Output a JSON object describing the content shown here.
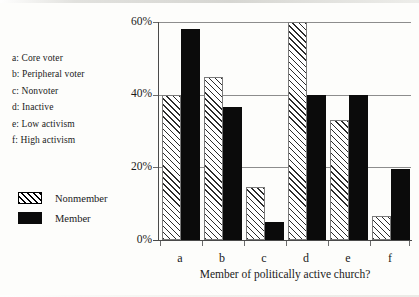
{
  "chart_data": {
    "type": "bar",
    "title": "",
    "xlabel": "Member of politically active church?",
    "ylabel": "",
    "categories": [
      "a",
      "b",
      "c",
      "d",
      "e",
      "f"
    ],
    "category_key": [
      "a: Core voter",
      "b: Peripheral voter",
      "c: Nonvoter",
      "d: Inactive",
      "e: Low activism",
      "f: High activism"
    ],
    "series": [
      {
        "name": "Nonmember",
        "style": "hatched",
        "color": "#ffffff",
        "values": [
          40,
          45,
          14.5,
          60,
          33,
          6.5
        ]
      },
      {
        "name": "Member",
        "style": "solid",
        "color": "#0b0b0b",
        "values": [
          58,
          36.5,
          5,
          40,
          40,
          19.5
        ]
      }
    ],
    "ylim": [
      0,
      60
    ],
    "ytick_values": [
      0,
      20,
      40,
      60
    ],
    "ytick_labels": [
      "0%",
      "20%",
      "40%",
      "60%"
    ],
    "grid": "horizontal",
    "legend_position": "left-outside",
    "value_suffix": "%"
  },
  "legend": {
    "entries": [
      {
        "label": "Nonmember",
        "swatch": "hatch-swatch-icon"
      },
      {
        "label": "Member",
        "swatch": "solid-swatch-icon"
      }
    ]
  }
}
